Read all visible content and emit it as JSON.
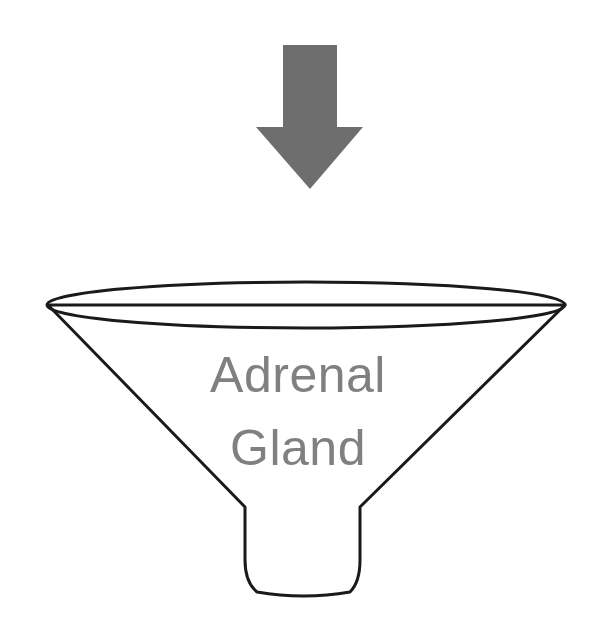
{
  "figure": {
    "background_color": "#ffffff",
    "width": 606,
    "height": 636
  },
  "arrow": {
    "name": "downward-arrow",
    "direction": "down",
    "fill_color": "#6e6e6e",
    "shaft": {
      "x_left": 283,
      "x_right": 337,
      "y_top": 45,
      "y_bottom": 127
    },
    "head": {
      "x_left": 256,
      "x_right": 363,
      "y_top": 127,
      "tip_x": 310,
      "tip_y": 189
    }
  },
  "funnel": {
    "name": "funnel-shape",
    "stroke_color": "#1a1a1a",
    "fill_color": "#ffffff",
    "stroke_width": 3,
    "rim": {
      "center_x": 306,
      "center_y": 305,
      "radius_x": 259,
      "radius_y": 23
    },
    "cone": {
      "left_vertex_x": 48,
      "right_vertex_x": 565,
      "vertex_y": 305,
      "neck_y": 507,
      "neck_left_x": 245,
      "neck_right_x": 360
    },
    "stem": {
      "top_y": 507,
      "bottom_y": 593,
      "top_left_x": 245,
      "top_right_x": 360,
      "bottom_left_x": 257,
      "bottom_right_x": 350
    }
  },
  "label": {
    "name": "adrenal-gland-label",
    "color": "#808080",
    "font_size": 50,
    "line1": "Adrenal",
    "line2": "Gland",
    "line1_x": 298,
    "line1_y": 392,
    "line2_x": 298,
    "line2_y": 465
  }
}
